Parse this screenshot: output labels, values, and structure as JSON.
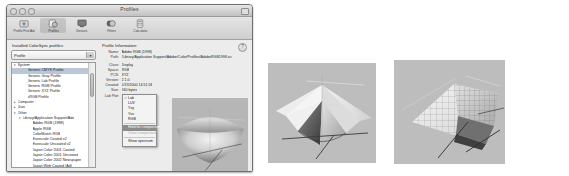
{
  "window": {
    "title": "Profiles",
    "traffic_lights": [
      "close",
      "minimize",
      "zoom"
    ]
  },
  "toolbar": {
    "items": [
      {
        "label": "Profile First Aid",
        "icon": "first-aid-icon",
        "selected": false
      },
      {
        "label": "Profiles",
        "icon": "profiles-icon",
        "selected": true
      },
      {
        "label": "Devices",
        "icon": "devices-icon",
        "selected": false
      },
      {
        "label": "Filters",
        "icon": "filters-icon",
        "selected": false
      },
      {
        "label": "Calculator",
        "icon": "calculator-icon",
        "selected": false
      }
    ]
  },
  "sidebar": {
    "heading": "Installed ColorSync profiles:",
    "filter_label": "Profile",
    "filter_value": "Profile",
    "rows": [
      {
        "label": "System",
        "depth": 0,
        "twisty": "▾",
        "selected": false
      },
      {
        "label": "Generic CMYK Profile",
        "depth": 2,
        "twisty": "",
        "selected": true
      },
      {
        "label": "Generic Gray Profile",
        "depth": 2,
        "twisty": "",
        "selected": false
      },
      {
        "label": "Generic Lab Profile",
        "depth": 2,
        "twisty": "",
        "selected": false
      },
      {
        "label": "Generic RGB Profile",
        "depth": 2,
        "twisty": "",
        "selected": false
      },
      {
        "label": "Generic XYZ Profile",
        "depth": 2,
        "twisty": "",
        "selected": false
      },
      {
        "label": "sRGB Profile",
        "depth": 2,
        "twisty": "",
        "selected": false
      },
      {
        "label": "Computer",
        "depth": 0,
        "twisty": "▸",
        "selected": false
      },
      {
        "label": "User",
        "depth": 0,
        "twisty": "▸",
        "selected": false
      },
      {
        "label": "Other",
        "depth": 0,
        "twisty": "▾",
        "selected": false
      },
      {
        "label": "Library/Application Support/Ado",
        "depth": 1,
        "twisty": "▾",
        "selected": false
      },
      {
        "label": "Adobe RGB (1998)",
        "depth": 3,
        "twisty": "",
        "selected": false
      },
      {
        "label": "Apple RGB",
        "depth": 3,
        "twisty": "",
        "selected": false
      },
      {
        "label": "ColorMatch RGB",
        "depth": 3,
        "twisty": "",
        "selected": false
      },
      {
        "label": "Euroscale Coated v2",
        "depth": 3,
        "twisty": "",
        "selected": false
      },
      {
        "label": "Euroscale Uncoated v2",
        "depth": 3,
        "twisty": "",
        "selected": false
      },
      {
        "label": "Japan Color 2001 Coated",
        "depth": 3,
        "twisty": "",
        "selected": false
      },
      {
        "label": "Japan Color 2001 Uncoated",
        "depth": 3,
        "twisty": "",
        "selected": false
      },
      {
        "label": "Japan Color 2002 Newspaper",
        "depth": 3,
        "twisty": "",
        "selected": false
      },
      {
        "label": "Japan Web Coated (Ad)",
        "depth": 3,
        "twisty": "",
        "selected": false
      },
      {
        "label": "sRGB IEC61966-2.1",
        "depth": 3,
        "twisty": "",
        "selected": false
      },
      {
        "label": "U.S. Sheetfed Coated v2",
        "depth": 3,
        "twisty": "",
        "selected": false
      },
      {
        "label": "U.S. Sheetfed Uncoated v2",
        "depth": 3,
        "twisty": "",
        "selected": false
      },
      {
        "label": "U.S. Web Coated (SWOP) v2",
        "depth": 3,
        "twisty": "",
        "selected": false
      },
      {
        "label": "U.S. Web Uncoated v2",
        "depth": 3,
        "twisty": "",
        "selected": false
      },
      {
        "label": "Library/Application Support/Ap",
        "depth": 1,
        "twisty": "▸",
        "selected": false
      },
      {
        "label": "Library/Printers/EPSON/ICCPro",
        "depth": 1,
        "twisty": "▸",
        "selected": false
      }
    ]
  },
  "info": {
    "heading": "Profile Information:",
    "fields": [
      {
        "key": "Name:",
        "value": "Adobe RGB (1998)"
      },
      {
        "key": "Path:",
        "value": "/Library/Application Support/Adobe/Color/Profiles/AdobeRGB1998.icc"
      }
    ],
    "details": [
      {
        "key": "Class:",
        "value": "Display"
      },
      {
        "key": "Space:",
        "value": "RGB"
      },
      {
        "key": "PCS:",
        "value": "XYZ"
      },
      {
        "key": "Version:",
        "value": "2.1.0"
      },
      {
        "key": "Created:",
        "value": "5/19/2000 14:51:58"
      },
      {
        "key": "Size:",
        "value": "560 bytes"
      }
    ],
    "lab_plot_key": "Lab Plot:",
    "help_button": "?"
  },
  "context_menu": {
    "items": [
      {
        "label": "Lab",
        "checked": true,
        "highlighted": false,
        "disabled": false
      },
      {
        "label": "LUV",
        "checked": false,
        "highlighted": false,
        "disabled": false
      },
      {
        "label": "Yxy",
        "checked": false,
        "highlighted": false,
        "disabled": false
      },
      {
        "label": "Yuv",
        "checked": false,
        "highlighted": false,
        "disabled": false
      },
      {
        "label": "RGB",
        "checked": false,
        "highlighted": false,
        "disabled": false
      },
      {
        "separator": true
      },
      {
        "label": "Hold for comparison",
        "checked": false,
        "highlighted": true,
        "disabled": false
      },
      {
        "label": "Clear comparison",
        "checked": false,
        "highlighted": false,
        "disabled": true
      },
      {
        "separator": true
      },
      {
        "label": "Show spectrum",
        "checked": false,
        "highlighted": false,
        "disabled": false
      }
    ]
  },
  "plots": [
    {
      "name": "lab-plot-in-window",
      "style": "shaded-solid",
      "background": "#b6b6b6"
    },
    {
      "name": "gamut-plot-diamond",
      "style": "shaded-solid",
      "background": "#bdbdbd"
    },
    {
      "name": "gamut-plot-wireframe",
      "style": "wireframe-mesh",
      "background": "#bdbdbd"
    }
  ]
}
